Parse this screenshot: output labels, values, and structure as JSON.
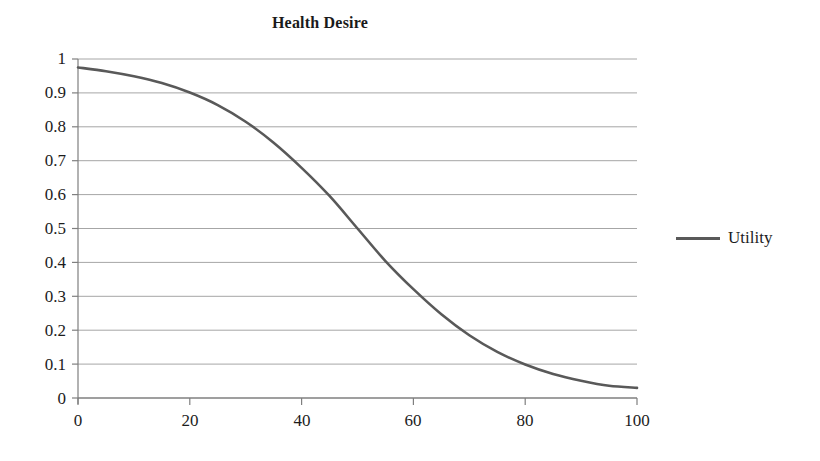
{
  "chart_data": {
    "type": "line",
    "title": "Health Desire",
    "xlabel": "",
    "ylabel": "",
    "xlim": [
      0,
      100
    ],
    "ylim": [
      0,
      1
    ],
    "grid": true,
    "grid_axis": "y",
    "legend_position": "right",
    "line_color": "#595959",
    "grid_color": "#a6a6a6",
    "axis_color": "#7f7f7f",
    "xticks": [
      "0",
      "20",
      "40",
      "60",
      "80",
      "100"
    ],
    "xtick_values": [
      0,
      20,
      40,
      60,
      80,
      100
    ],
    "yticks": [
      "0",
      "0.1",
      "0.2",
      "0.3",
      "0.4",
      "0.5",
      "0.6",
      "0.7",
      "0.8",
      "0.9",
      "1"
    ],
    "ytick_values": [
      0,
      0.1,
      0.2,
      0.3,
      0.4,
      0.5,
      0.6,
      0.7,
      0.8,
      0.9,
      1
    ],
    "series": [
      {
        "name": "Utility",
        "color": "#595959",
        "x": [
          0,
          5,
          10,
          15,
          20,
          25,
          30,
          35,
          40,
          45,
          50,
          55,
          60,
          65,
          70,
          75,
          80,
          85,
          90,
          95,
          100
        ],
        "values": [
          0.975,
          0.964,
          0.949,
          0.929,
          0.901,
          0.864,
          0.815,
          0.753,
          0.679,
          0.596,
          0.5,
          0.404,
          0.321,
          0.247,
          0.185,
          0.136,
          0.099,
          0.071,
          0.051,
          0.036,
          0.03
        ]
      }
    ],
    "legend": [
      "Utility"
    ]
  },
  "legend": {
    "utility_label": "Utility"
  }
}
